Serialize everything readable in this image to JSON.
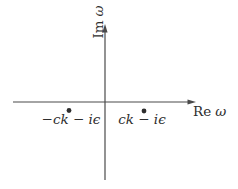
{
  "figure": {
    "background_color": "#ffffff",
    "line_color": "#4a4a4a",
    "text_color": "#2e2e2e",
    "axes": {
      "vertical_label_prefix": "Im",
      "vertical_label_symbol": "ω",
      "horizontal_label_prefix": "Re",
      "horizontal_label_symbol": "ω"
    },
    "poles": [
      {
        "label": "−ck − iϵ"
      },
      {
        "label": "ck − iϵ"
      }
    ]
  }
}
